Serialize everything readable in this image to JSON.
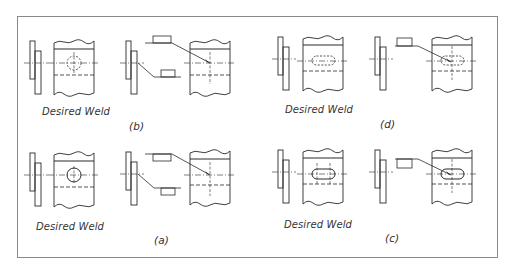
{
  "diagram": {
    "type": "weld-symbol-comparison",
    "panels": [
      {
        "id": "b",
        "row": 0,
        "col": 0,
        "desired_label": "Desired Weld",
        "caption": "(b)",
        "hole_shape": "circle",
        "hole_hidden": true,
        "symbol_side": "other-side"
      },
      {
        "id": "d",
        "row": 0,
        "col": 1,
        "desired_label": "Desired Weld",
        "caption": "(d)",
        "hole_shape": "slot",
        "hole_hidden": true,
        "symbol_side": "other-side"
      },
      {
        "id": "a",
        "row": 1,
        "col": 0,
        "desired_label": "Desired Weld",
        "caption": "(a)",
        "hole_shape": "circle",
        "hole_hidden": false,
        "symbol_side": "arrow-side"
      },
      {
        "id": "c",
        "row": 1,
        "col": 1,
        "desired_label": "Desired Weld",
        "caption": "(c)",
        "hole_shape": "slot",
        "hole_hidden": false,
        "symbol_side": "arrow-side"
      }
    ]
  },
  "labels": {
    "b_desired": "Desired Weld",
    "b_caption": "(b)",
    "d_desired": "Desired Weld",
    "d_caption": "(d)",
    "a_desired": "Desired Weld",
    "a_caption": "(a)",
    "c_desired": "Desired Weld",
    "c_caption": "(c)"
  },
  "colors": {
    "line": "#2a2a2a",
    "border": "#8a8a8a",
    "background": "#ffffff"
  }
}
